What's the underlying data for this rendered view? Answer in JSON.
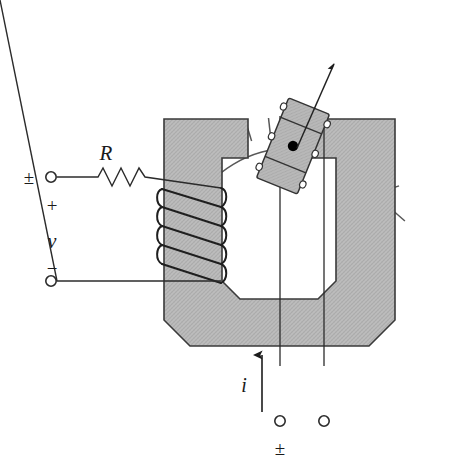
{
  "figure": {
    "background_color": "#ffffff",
    "width": 449,
    "height": 475
  },
  "colors": {
    "core_fill": "#b9b9b9",
    "core_stroke": "#3a3a3a",
    "armature_fill": "#b5b5b5",
    "armature_stroke": "#333333",
    "wire_stroke": "#2b2b2b",
    "coil_stroke": "#1f1f1f",
    "scale_stroke": "#555555",
    "tick_stroke": "#555555",
    "pointer_stroke": "#222222",
    "text_color": "#1a1a1a",
    "pivot_dot": "#000000"
  },
  "labels": {
    "resistor": "R",
    "voltage": "v",
    "terminal_top_sign": "±",
    "plus_sign": "+",
    "minus_sign": "−",
    "current": "i",
    "terminal_bottom_sign": "±"
  },
  "components": {
    "scale_arc": {
      "name": "meter-scale-arc",
      "tick_count": 13,
      "center_x": 291,
      "center_y": 156,
      "radius": 112,
      "start_angle_deg": 208,
      "end_angle_deg": 332
    },
    "pointer": {
      "name": "pointer-needle",
      "angle_deg": 62,
      "tip_x": 334,
      "tip_y": 62
    },
    "armature": {
      "name": "moving-iron-armature",
      "tilt_deg": 22,
      "winding_bands": 3,
      "pivot_marked": true
    },
    "coil": {
      "name": "field-coil-winding",
      "turns": 5
    },
    "resistor": {
      "name": "series-resistor",
      "zigzag_peaks": 6
    },
    "core": {
      "name": "u-shaped-magnetic-core",
      "shape": "U",
      "chamfered_corners": true
    },
    "terminals": {
      "left_top": "voltage-terminal-positive",
      "left_bottom": "voltage-terminal-negative",
      "bottom_left": "current-terminal-a",
      "bottom_right": "current-terminal-b"
    },
    "conductors": {
      "name": "vertical-current-conductors",
      "count": 2
    }
  }
}
